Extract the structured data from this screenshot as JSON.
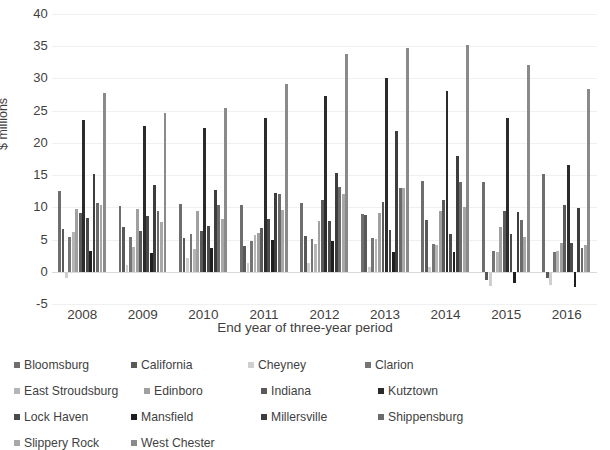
{
  "chart_data": {
    "type": "bar",
    "title": "",
    "xlabel": "End year of three-year period",
    "ylabel": "$ millions",
    "ylim": [
      -5,
      40
    ],
    "yticks": [
      -5,
      0,
      5,
      10,
      15,
      20,
      25,
      30,
      35,
      40
    ],
    "grid": true,
    "legend_position": "bottom",
    "categories": [
      "2008",
      "2009",
      "2010",
      "2011",
      "2012",
      "2013",
      "2014",
      "2015",
      "2016"
    ],
    "series": [
      {
        "name": "Bloomsburg",
        "color": "#6e6e6e",
        "values": [
          12.6,
          10.2,
          10.5,
          10.4,
          10.6,
          9.0,
          14.1,
          13.9,
          15.1
        ]
      },
      {
        "name": "California",
        "color": "#595959",
        "values": [
          6.6,
          6.9,
          5.2,
          4.0,
          5.5,
          8.8,
          8.1,
          -1.3,
          -1.0
        ]
      },
      {
        "name": "Cheyney",
        "color": "#cfcfcf",
        "values": [
          -1.0,
          1.0,
          2.2,
          1.4,
          1.3,
          0.7,
          0.7,
          -2.2,
          -2.0
        ]
      },
      {
        "name": "Clarion",
        "color": "#757575",
        "values": [
          5.4,
          5.4,
          5.9,
          4.8,
          5.1,
          5.2,
          4.3,
          3.3,
          3.0
        ]
      },
      {
        "name": "East Stroudsburg",
        "color": "#b5b5b5",
        "values": [
          6.2,
          3.8,
          3.5,
          5.7,
          4.3,
          5.1,
          4.2,
          3.0,
          3.3
        ]
      },
      {
        "name": "Edinboro",
        "color": "#a0a0a0",
        "values": [
          9.7,
          9.7,
          9.4,
          6.0,
          7.9,
          9.1,
          9.5,
          6.9,
          4.4
        ]
      },
      {
        "name": "Indiana",
        "color": "#5a5a5a",
        "values": [
          9.1,
          6.4,
          6.3,
          6.8,
          11.1,
          10.8,
          11.2,
          9.5,
          10.4
        ]
      },
      {
        "name": "Kutztown",
        "color": "#2b2b2b",
        "values": [
          23.5,
          22.6,
          22.3,
          23.9,
          27.2,
          30.0,
          28.0,
          23.9,
          16.6
        ]
      },
      {
        "name": "Lock Haven",
        "color": "#4a4a4a",
        "values": [
          8.4,
          8.6,
          7.1,
          8.2,
          7.9,
          6.5,
          5.9,
          5.9,
          4.5
        ]
      },
      {
        "name": "Mansfield",
        "color": "#1f1f1f",
        "values": [
          3.2,
          2.9,
          3.7,
          5.0,
          4.7,
          3.1,
          3.0,
          -1.8,
          -2.3
        ]
      },
      {
        "name": "Millersville",
        "color": "#3d3d3d",
        "values": [
          15.2,
          13.4,
          12.7,
          12.3,
          15.4,
          21.9,
          17.9,
          9.3,
          9.9
        ]
      },
      {
        "name": "Shippensburg",
        "color": "#6b6b6b",
        "values": [
          10.6,
          9.4,
          10.4,
          12.0,
          13.2,
          13.0,
          13.9,
          8.1,
          3.7
        ]
      },
      {
        "name": "Slippery Rock",
        "color": "#a8a8a8",
        "values": [
          10.3,
          7.7,
          8.2,
          9.6,
          12.1,
          13.0,
          10.0,
          5.4,
          4.2
        ]
      },
      {
        "name": "West Chester",
        "color": "#8a8a8a",
        "values": [
          27.8,
          24.6,
          25.4,
          29.1,
          33.8,
          34.8,
          35.2,
          32.1,
          28.4
        ]
      }
    ]
  },
  "axes": {
    "ylabel": "$ millions",
    "xlabel": "End year of three-year period",
    "yticks": [
      "40",
      "35",
      "30",
      "25",
      "20",
      "15",
      "10",
      "5",
      "0",
      "-5"
    ],
    "xticks": [
      "2008",
      "2009",
      "2010",
      "2011",
      "2012",
      "2013",
      "2014",
      "2015",
      "2016"
    ]
  },
  "legend": {
    "items": [
      {
        "label": "Bloomsburg",
        "color": "#6e6e6e"
      },
      {
        "label": "California",
        "color": "#595959"
      },
      {
        "label": "Cheyney",
        "color": "#cfcfcf"
      },
      {
        "label": "Clarion",
        "color": "#757575"
      },
      {
        "label": "East Stroudsburg",
        "color": "#b5b5b5"
      },
      {
        "label": "Edinboro",
        "color": "#a0a0a0"
      },
      {
        "label": "Indiana",
        "color": "#5a5a5a"
      },
      {
        "label": "Kutztown",
        "color": "#2b2b2b"
      },
      {
        "label": "Lock Haven",
        "color": "#4a4a4a"
      },
      {
        "label": "Mansfield",
        "color": "#1f1f1f"
      },
      {
        "label": "Millersville",
        "color": "#3d3d3d"
      },
      {
        "label": "Shippensburg",
        "color": "#6b6b6b"
      },
      {
        "label": "Slippery Rock",
        "color": "#a8a8a8"
      },
      {
        "label": "West Chester",
        "color": "#8a8a8a"
      }
    ]
  }
}
